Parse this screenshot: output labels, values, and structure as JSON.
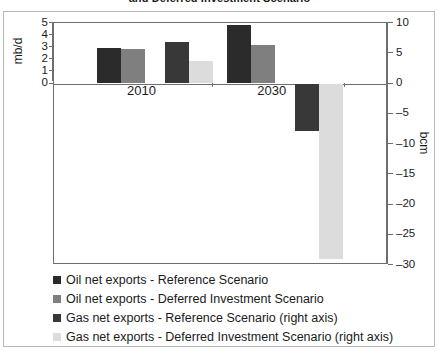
{
  "chart_data": {
    "type": "bar",
    "title": "and Deferred Investment Scenario",
    "categories": [
      "2010",
      "2030"
    ],
    "xlabel": "",
    "ylabel": "mb/d",
    "ylabel_right": "bcm",
    "ylim": [
      0,
      5
    ],
    "ylim_right": [
      -30,
      10
    ],
    "yticks": [
      "5",
      "4",
      "3",
      "2",
      "1",
      "0"
    ],
    "yticks_right": [
      "10",
      "5",
      "0",
      "-5",
      "-10",
      "-15",
      "-20",
      "-25",
      "-30"
    ],
    "grid": false,
    "legend_position": "below",
    "series": [
      {
        "name": "Oil net exports - Reference Scenario",
        "axis": "left",
        "unit": "mb/d",
        "color": "#2b2b2b",
        "values": [
          2.95,
          4.85
        ]
      },
      {
        "name": "Oil net exports - Deferred Investment Scenario",
        "axis": "left",
        "unit": "mb/d",
        "color": "#7f7f7f",
        "values": [
          2.85,
          3.15
        ]
      },
      {
        "name": "Gas net exports - Reference Scenario (right axis)",
        "axis": "right",
        "unit": "bcm",
        "color": "#383838",
        "values": [
          6.8,
          -7.8
        ]
      },
      {
        "name": "Gas net exports - Deferred Investment Scenario (right axis)",
        "axis": "right",
        "unit": "bcm",
        "color": "#dcdcdc",
        "values": [
          3.8,
          -29.0
        ]
      }
    ]
  },
  "axes": {
    "left": {
      "label": "mb/d",
      "ticks": [
        "5",
        "4",
        "3",
        "2",
        "1",
        "0"
      ]
    },
    "right": {
      "label": "bcm",
      "ticks": [
        "10",
        "5",
        "0",
        "-5",
        "-10",
        "-15",
        "-20",
        "-25",
        "-30"
      ]
    },
    "categories": [
      "2010",
      "2030"
    ]
  },
  "title": "and Deferred Investment Scenario",
  "legend": [
    {
      "label": "Oil net exports - Reference Scenario",
      "color": "#2b2b2b"
    },
    {
      "label": "Oil net exports - Deferred Investment Scenario",
      "color": "#7f7f7f"
    },
    {
      "label": "Gas net exports - Reference Scenario (right axis)",
      "color": "#383838"
    },
    {
      "label": "Gas net exports - Deferred Investment Scenario (right axis)",
      "color": "#dcdcdc"
    }
  ]
}
